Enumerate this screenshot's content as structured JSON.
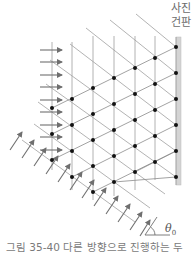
{
  "plate": {
    "label_line1": "사진",
    "label_line2": "건판"
  },
  "angle": {
    "symbol": "θ",
    "subscript": "0"
  },
  "caption": {
    "text": "그림 35-40  다른 방향으로 진행하는 두"
  },
  "colors": {
    "lines": "#9a9a9a",
    "arrows": "#6f6f6f",
    "dots": "#111111",
    "plate": "#d4d4d4"
  },
  "lattice": {
    "vertical_lines_x": [
      52,
      72,
      93,
      114,
      135,
      155
    ],
    "dots": [
      [
        176,
        47
      ],
      [
        176,
        73
      ],
      [
        176,
        99
      ],
      [
        176,
        125
      ],
      [
        176,
        151
      ],
      [
        176,
        177
      ],
      [
        155,
        58
      ],
      [
        155,
        84
      ],
      [
        155,
        110
      ],
      [
        155,
        136
      ],
      [
        155,
        162
      ],
      [
        135,
        68
      ],
      [
        135,
        94
      ],
      [
        135,
        120
      ],
      [
        135,
        146
      ],
      [
        135,
        172
      ],
      [
        114,
        78
      ],
      [
        114,
        104
      ],
      [
        114,
        130
      ],
      [
        114,
        156
      ],
      [
        114,
        182
      ],
      [
        93,
        88
      ],
      [
        93,
        114
      ],
      [
        93,
        140
      ],
      [
        93,
        166
      ],
      [
        93,
        192
      ],
      [
        72,
        99
      ],
      [
        72,
        125
      ],
      [
        72,
        151
      ],
      [
        72,
        177
      ],
      [
        52,
        108
      ],
      [
        52,
        134
      ],
      [
        52,
        160
      ]
    ]
  },
  "horizontal_arrows_y": [
    50,
    62,
    75,
    87,
    100,
    112,
    125,
    137,
    150
  ],
  "tilted_arrows_base": [
    [
      10,
      152
    ],
    [
      22,
      160
    ],
    [
      34,
      168
    ],
    [
      46,
      176
    ],
    [
      58,
      184
    ],
    [
      70,
      192
    ],
    [
      82,
      200
    ],
    [
      94,
      208
    ],
    [
      106,
      216
    ],
    [
      118,
      224
    ],
    [
      130,
      232
    ],
    [
      142,
      240
    ]
  ]
}
